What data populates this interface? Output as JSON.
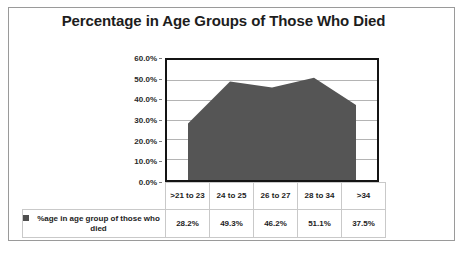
{
  "chart_data": {
    "type": "area",
    "title": "Percentage in Age Groups of Those Who Died",
    "categories": [
      ">21 to 23",
      "24 to 25",
      "26 to 27",
      "28 to 34",
      ">34"
    ],
    "values": [
      28.2,
      49.3,
      46.2,
      51.1,
      37.5
    ],
    "value_labels": [
      "28.2%",
      "49.3%",
      "46.2%",
      "51.1%",
      "37.5%"
    ],
    "series": [
      {
        "name": "%age in age group of those who died",
        "values": [
          28.2,
          49.3,
          46.2,
          51.1,
          37.5
        ]
      }
    ],
    "xlabel": "",
    "ylabel": "",
    "ylim": [
      0,
      60
    ],
    "y_ticks": [
      0,
      10,
      20,
      30,
      40,
      50,
      60
    ],
    "y_tick_labels": [
      "0.0%",
      "10.0%",
      "20.0%",
      "30.0%",
      "40.0%",
      "50.0%",
      "60.0%"
    ],
    "grid": true,
    "legend_position": "data-table",
    "series_color": "#555555",
    "plot_border_color": "#141414",
    "gridline_color": "#b4b4b4"
  },
  "legend": {
    "series_label": "%age in age group of those who died",
    "marker_name": "series-color-swatch"
  }
}
